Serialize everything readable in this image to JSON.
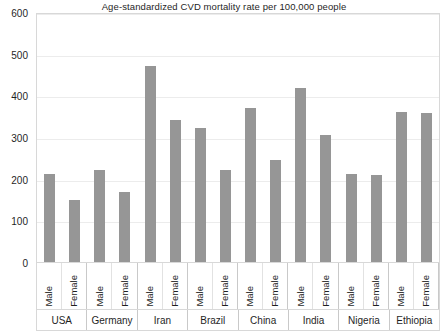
{
  "chart_data": {
    "type": "bar",
    "title": "Age-standardized CVD mortality rate per 100,000 people",
    "xlabel": "",
    "ylabel": "",
    "ylim": [
      0,
      600
    ],
    "yticks": [
      600,
      500,
      400,
      300,
      200,
      100,
      0
    ],
    "grid": true,
    "legend": "none",
    "categories": [
      "USA",
      "Germany",
      "Iran",
      "Brazil",
      "China",
      "India",
      "Nigeria",
      "Ethiopia"
    ],
    "series": [
      {
        "name": "Male",
        "values": [
          212,
          221,
          471,
          322,
          369,
          418,
          212,
          359
        ]
      },
      {
        "name": "Female",
        "values": [
          150,
          167,
          340,
          220,
          245,
          305,
          208,
          358
        ]
      }
    ],
    "bars": [
      {
        "category": "USA",
        "series": "Male",
        "value": 212
      },
      {
        "category": "USA",
        "series": "Female",
        "value": 150
      },
      {
        "category": "Germany",
        "series": "Male",
        "value": 221
      },
      {
        "category": "Germany",
        "series": "Female",
        "value": 167
      },
      {
        "category": "Iran",
        "series": "Male",
        "value": 471
      },
      {
        "category": "Iran",
        "series": "Female",
        "value": 340
      },
      {
        "category": "Brazil",
        "series": "Male",
        "value": 322
      },
      {
        "category": "Brazil",
        "series": "Female",
        "value": 220
      },
      {
        "category": "China",
        "series": "Male",
        "value": 369
      },
      {
        "category": "China",
        "series": "Female",
        "value": 245
      },
      {
        "category": "India",
        "series": "Male",
        "value": 418
      },
      {
        "category": "India",
        "series": "Female",
        "value": 305
      },
      {
        "category": "Nigeria",
        "series": "Male",
        "value": 212
      },
      {
        "category": "Nigeria",
        "series": "Female",
        "value": 208
      },
      {
        "category": "Ethiopia",
        "series": "Male",
        "value": 359
      },
      {
        "category": "Ethiopia",
        "series": "Female",
        "value": 358
      }
    ],
    "colors": {
      "bar": "#969696",
      "gridline": "#ececec",
      "axis_border": "#d8d8d8",
      "text": "#1f1f1f",
      "background": "#ffffff"
    }
  }
}
